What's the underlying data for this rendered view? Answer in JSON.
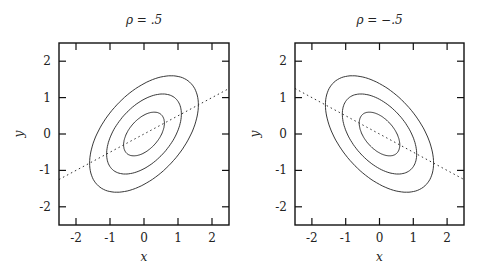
{
  "chart_data": [
    {
      "type": "line",
      "title": "ρ = .5",
      "xlabel": "x",
      "ylabel": "y",
      "xlim": [
        -2.5,
        2.5
      ],
      "ylim": [
        -2.5,
        2.5
      ],
      "xticks": [
        "-2",
        "-1",
        "0",
        "1",
        "2"
      ],
      "yticks": [
        "-2",
        "-1",
        "0",
        "1",
        "2"
      ],
      "grid": false,
      "correlation": 0.5,
      "contours": [
        {
          "level": "inner",
          "x_halfwidth": 0.6,
          "y_halfwidth": 0.6
        },
        {
          "level": "middle",
          "x_halfwidth": 1.1,
          "y_halfwidth": 1.1
        },
        {
          "level": "outer",
          "x_halfwidth": 1.6,
          "y_halfwidth": 1.6
        }
      ],
      "regression_line": {
        "style": "dotted",
        "slope": 0.5,
        "intercept": 0,
        "x": [
          -2.5,
          2.5
        ],
        "y": [
          -1.25,
          1.25
        ]
      }
    },
    {
      "type": "line",
      "title": "ρ = −.5",
      "xlabel": "x",
      "ylabel": "y",
      "xlim": [
        -2.5,
        2.5
      ],
      "ylim": [
        -2.5,
        2.5
      ],
      "xticks": [
        "-2",
        "-1",
        "0",
        "1",
        "2"
      ],
      "yticks": [
        "-2",
        "-1",
        "0",
        "1",
        "2"
      ],
      "grid": false,
      "correlation": -0.5,
      "contours": [
        {
          "level": "inner",
          "x_halfwidth": 0.6,
          "y_halfwidth": 0.6
        },
        {
          "level": "middle",
          "x_halfwidth": 1.1,
          "y_halfwidth": 1.1
        },
        {
          "level": "outer",
          "x_halfwidth": 1.6,
          "y_halfwidth": 1.6
        }
      ],
      "regression_line": {
        "style": "dotted",
        "slope": -0.5,
        "intercept": 0,
        "x": [
          -2.5,
          2.5
        ],
        "y": [
          1.25,
          -1.25
        ]
      }
    }
  ],
  "panels": [
    {
      "title": "ρ = .5",
      "xlabel": "x",
      "ylabel": "y",
      "rho": 0.5
    },
    {
      "title": "ρ = −.5",
      "xlabel": "x",
      "ylabel": "y",
      "rho": -0.5
    }
  ],
  "ticks": [
    "-2",
    "-1",
    "0",
    "1",
    "2"
  ],
  "contour_radii": [
    0.6,
    1.1,
    1.6
  ]
}
